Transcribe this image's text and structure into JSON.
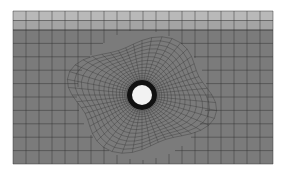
{
  "figure": {
    "type": "finite-element-mesh",
    "colors": {
      "background": "#ffffff",
      "plate": "#7b7b7b",
      "top_layer_1": "#b9b9b9",
      "top_layer_2": "#a4a4a4",
      "grid_line": "#333333",
      "hole_fill": "#f2f2f2",
      "hole_ring": "#111111"
    },
    "geometry": {
      "plate": {
        "x": 13,
        "y": 11,
        "width": 260,
        "height": 153
      },
      "top_layer": {
        "rows": 2,
        "height": 19
      },
      "hole": {
        "cx": 142,
        "cy": 95,
        "r": 10,
        "ring_r": 15
      },
      "outer_grid": {
        "cols": 20,
        "rows": 12
      },
      "radial_mesh": {
        "spokes": 48,
        "rings": 14,
        "outer_radius": 70
      }
    }
  }
}
